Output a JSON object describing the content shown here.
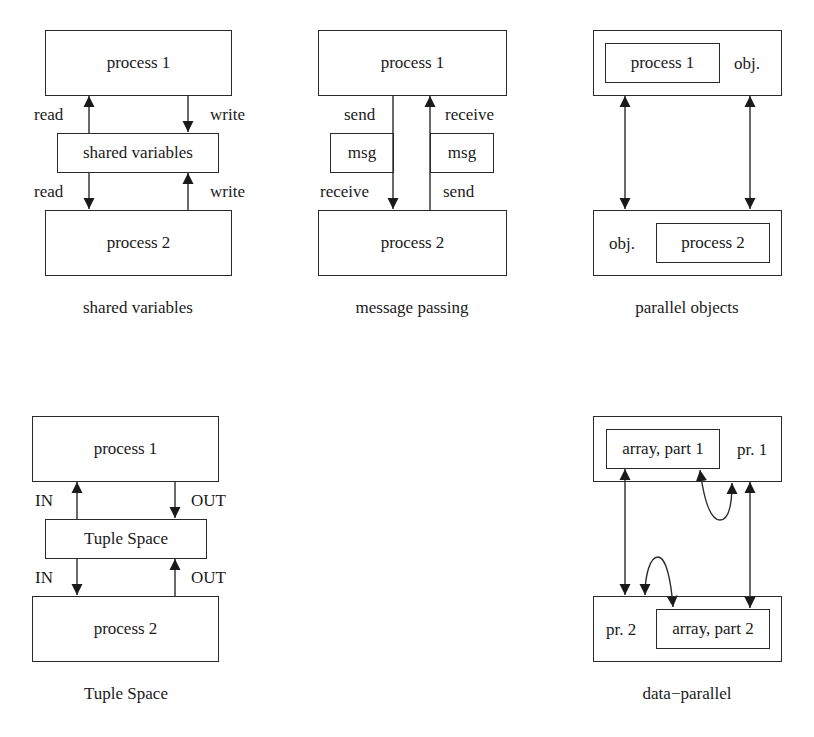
{
  "panels": {
    "shared_variables": {
      "top_box": "process 1",
      "middle_box": "shared variables",
      "bottom_box": "process 2",
      "labels": {
        "top_left": "read",
        "top_right": "write",
        "bottom_left": "read",
        "bottom_right": "write"
      },
      "caption": "shared variables"
    },
    "message_passing": {
      "top_box": "process 1",
      "msg_left": "msg",
      "msg_right": "msg",
      "bottom_box": "process 2",
      "labels": {
        "top_left": "send",
        "top_right": "receive",
        "bottom_left": "receive",
        "bottom_right": "send"
      },
      "caption": "message passing"
    },
    "parallel_objects": {
      "top_inner": "process 1",
      "top_outer_label": "obj.",
      "bottom_outer_label": "obj.",
      "bottom_inner": "process 2",
      "caption": "parallel objects"
    },
    "tuple_space": {
      "top_box": "process 1",
      "middle_box": "Tuple Space",
      "bottom_box": "process 2",
      "labels": {
        "top_left": "IN",
        "top_right": "OUT",
        "bottom_left": "IN",
        "bottom_right": "OUT"
      },
      "caption": "Tuple Space"
    },
    "data_parallel": {
      "top_inner": "array, part 1",
      "top_outer_label": "pr. 1",
      "bottom_outer_label": "pr. 2",
      "bottom_inner": "array, part 2",
      "caption": "data−parallel"
    }
  },
  "colors": {
    "line": "#2a2a2a",
    "background": "#ffffff"
  }
}
